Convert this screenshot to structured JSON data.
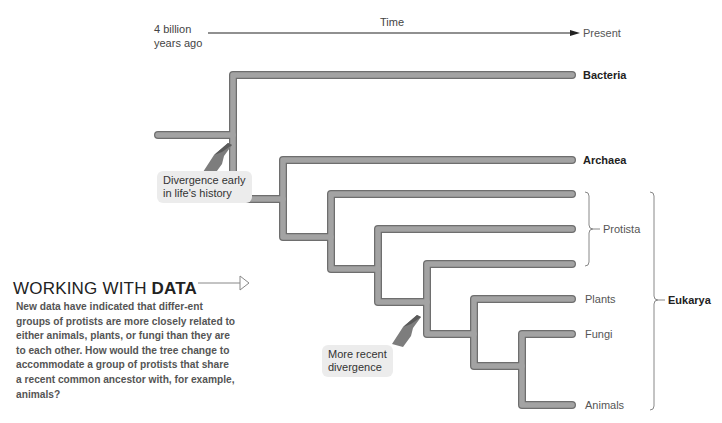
{
  "timeline": {
    "start_label_line1": "4 billion",
    "start_label_line2": "years ago",
    "axis_label": "Time",
    "end_label": "Present"
  },
  "tree": {
    "branch_color": "#9a9a9a",
    "branch_outline": "#6e6e6e",
    "leaves": [
      {
        "label": "Bacteria",
        "bold": true
      },
      {
        "label": "Archaea",
        "bold": true
      },
      {
        "label": "",
        "bold": false
      },
      {
        "label": "",
        "bold": false
      },
      {
        "label": "",
        "bold": false
      },
      {
        "label": "Plants",
        "bold": false
      },
      {
        "label": "Fungi",
        "bold": false
      },
      {
        "label": "Animals",
        "bold": false
      }
    ],
    "groups": {
      "protista": "Protista",
      "eukarya": "Eukarya"
    }
  },
  "callouts": {
    "early": {
      "line1": "Divergence early",
      "line2": "in life's history"
    },
    "recent": {
      "line1": "More recent",
      "line2": "divergence"
    }
  },
  "working_with_data": {
    "title_regular": "WORKING WITH ",
    "title_bold": "DATA",
    "body": "New data have indicated that differ-ent groups of protists are more closely related to either animals, plants, or fungi than they are to each other. How would the tree change to accommodate a group of protists that share a recent common ancestor with, for example, animals?"
  }
}
